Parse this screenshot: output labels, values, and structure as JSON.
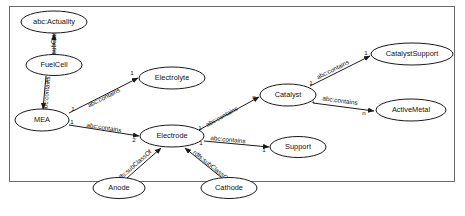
{
  "diagram": {
    "type": "ontology-class-diagram",
    "title": "",
    "frame": {
      "border_color": "#6b6b6b",
      "background": "#ffffff"
    },
    "nodes": [
      {
        "id": "actuality",
        "label": "abc:Actuality",
        "cx": 54,
        "cy": 22,
        "rx": 33,
        "ry": 11
      },
      {
        "id": "fuelcell",
        "label": "FuelCell",
        "cx": 54,
        "cy": 65,
        "rx": 28,
        "ry": 10.5
      },
      {
        "id": "mea",
        "label": "MEA",
        "cx": 42,
        "cy": 120,
        "rx": 27,
        "ry": 11
      },
      {
        "id": "electrolyte",
        "label": "Electrolyte",
        "cx": 172,
        "cy": 78,
        "rx": 33,
        "ry": 11
      },
      {
        "id": "electrode",
        "label": "Electrode",
        "cx": 172,
        "cy": 136,
        "rx": 32,
        "ry": 11
      },
      {
        "id": "anode",
        "label": "Anode",
        "cx": 119,
        "cy": 188,
        "rx": 26,
        "ry": 10.5
      },
      {
        "id": "cathode",
        "label": "Cathode",
        "cx": 229,
        "cy": 188,
        "rx": 28,
        "ry": 10.5
      },
      {
        "id": "support",
        "label": "Support",
        "cx": 298,
        "cy": 147,
        "rx": 28,
        "ry": 10.5
      },
      {
        "id": "catalyst",
        "label": "Catalyst",
        "cx": 288,
        "cy": 95,
        "rx": 28,
        "ry": 11
      },
      {
        "id": "catalystsupport",
        "label": "CatalystSupport",
        "cx": 412,
        "cy": 54,
        "rx": 41,
        "ry": 11
      },
      {
        "id": "activemetal",
        "label": "ActiveMetal",
        "cx": 411,
        "cy": 110,
        "rx": 35,
        "ry": 11
      }
    ],
    "edges": [
      {
        "id": "e1",
        "from": "fuelcell",
        "to": "actuality",
        "label": "rdfs:subClassOf",
        "label_x": 54,
        "label_y": 44,
        "source_card": "",
        "target_card": "",
        "x1": 54,
        "y1": 54,
        "x2": 54,
        "y2": 34
      },
      {
        "id": "e2",
        "from": "fuelcell",
        "to": "mea",
        "label": "abc:contains",
        "label_x": 47,
        "label_y": 94,
        "source_card": "1",
        "target_card": "n",
        "sx": 47,
        "sy": 80,
        "tx": 43,
        "ty": 113,
        "x1": 46,
        "y1": 76,
        "x2": 43,
        "y2": 109
      },
      {
        "id": "e3",
        "from": "mea",
        "to": "electrolyte",
        "label": "abc:contains",
        "label_x": 104,
        "label_y": 98,
        "source_card": "1",
        "target_card": "1",
        "sx": 73,
        "sy": 109,
        "tx": 132,
        "ty": 73,
        "x1": 69,
        "y1": 113,
        "x2": 138,
        "y2": 78
      },
      {
        "id": "e4",
        "from": "mea",
        "to": "electrode",
        "label": "abc:contains",
        "label_x": 104,
        "label_y": 128,
        "source_card": "1",
        "target_card": "2",
        "sx": 72,
        "sy": 122,
        "tx": 134,
        "ty": 140,
        "x1": 69,
        "y1": 125,
        "x2": 139,
        "y2": 136
      },
      {
        "id": "e5",
        "from": "anode",
        "to": "electrode",
        "label": "rdfs:subClassOf",
        "label_x": 134,
        "label_y": 166,
        "source_card": "",
        "target_card": "",
        "x1": 127,
        "y1": 178,
        "x2": 161,
        "y2": 148
      },
      {
        "id": "e6",
        "from": "cathode",
        "to": "electrode",
        "label": "rdfs:subClassOf",
        "label_x": 211,
        "label_y": 166,
        "source_card": "",
        "target_card": "",
        "x1": 222,
        "y1": 178,
        "x2": 185,
        "y2": 148
      },
      {
        "id": "e7",
        "from": "electrode",
        "to": "catalyst",
        "label": "abc:contains",
        "label_x": 222,
        "label_y": 117,
        "source_card": "1",
        "target_card": "n",
        "sx": 200,
        "sy": 128,
        "tx": 254,
        "ty": 97,
        "x1": 199,
        "y1": 130,
        "x2": 259,
        "y2": 97
      },
      {
        "id": "e8",
        "from": "electrode",
        "to": "support",
        "label": "abc:contains",
        "label_x": 228,
        "label_y": 140,
        "source_card": "1",
        "target_card": "1",
        "sx": 201,
        "sy": 143,
        "tx": 264,
        "ty": 150,
        "x1": 204,
        "y1": 141,
        "x2": 269,
        "y2": 147
      },
      {
        "id": "e9",
        "from": "catalyst",
        "to": "catalystsupport",
        "label": "abc:contains",
        "label_x": 333,
        "label_y": 70,
        "source_card": "1",
        "target_card": "1",
        "sx": 311,
        "sy": 83,
        "tx": 366,
        "ty": 53,
        "x1": 310,
        "y1": 86,
        "x2": 370,
        "y2": 56
      },
      {
        "id": "e10",
        "from": "catalyst",
        "to": "activemetal",
        "label": "abc:contains",
        "label_x": 340,
        "label_y": 101,
        "source_card": "1",
        "target_card": "n",
        "sx": 313,
        "sy": 101,
        "tx": 364,
        "ty": 113,
        "x1": 313,
        "y1": 103,
        "x2": 374,
        "y2": 111
      }
    ]
  }
}
